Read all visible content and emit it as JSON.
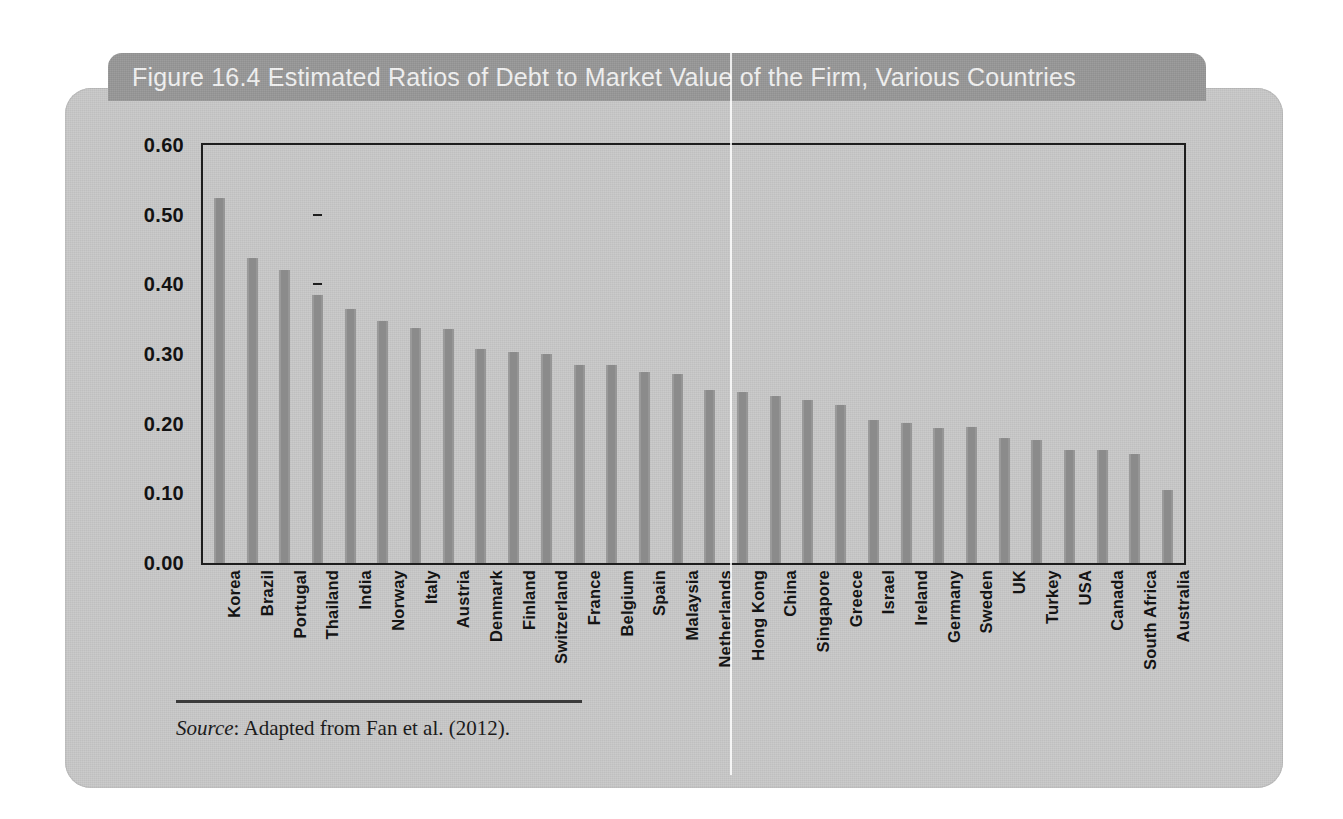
{
  "figure": {
    "number": "Figure 16.4",
    "title": "Estimated Ratios of Debt to Market Value of the Firm, Various Countries",
    "full_title": "Figure 16.4  Estimated Ratios of Debt to Market Value of the Firm, Various Countries",
    "source_label": "Source",
    "source_text": ": Adapted from Fan et al. (2012)."
  },
  "colors": {
    "card_background": "#c8c8c8",
    "title_tab": "#979797",
    "title_text": "#f2f2f2",
    "bar_fill": "#8e8e8e",
    "axis_line": "#1e1e1e",
    "label_text": "#121212"
  },
  "chart_data": {
    "type": "bar",
    "title": "Estimated Ratios of Debt to Market Value of the Firm, Various Countries",
    "subtitle": "",
    "xlabel": "",
    "ylabel": "",
    "ylim": [
      0.0,
      0.6
    ],
    "ytick_labels": [
      "0.00",
      "0.10",
      "0.20",
      "0.30",
      "0.40",
      "0.50",
      "0.60"
    ],
    "ytick_values": [
      0.0,
      0.1,
      0.2,
      0.3,
      0.4,
      0.5,
      0.6
    ],
    "grid": false,
    "legend": false,
    "orientation": "vertical",
    "categories": [
      "Korea",
      "Brazil",
      "Portugal",
      "Thailand",
      "India",
      "Norway",
      "Italy",
      "Austria",
      "Denmark",
      "Finland",
      "Switzerland",
      "France",
      "Belgium",
      "Spain",
      "Malaysia",
      "Netherlands",
      "Hong Kong",
      "China",
      "Singapore",
      "Greece",
      "Israel",
      "Ireland",
      "Germany",
      "Sweden",
      "UK",
      "Turkey",
      "USA",
      "Canada",
      "South Africa",
      "Australia"
    ],
    "values": [
      0.524,
      0.438,
      0.42,
      0.384,
      0.364,
      0.347,
      0.338,
      0.336,
      0.307,
      0.303,
      0.3,
      0.284,
      0.284,
      0.274,
      0.271,
      0.248,
      0.246,
      0.24,
      0.234,
      0.227,
      0.206,
      0.201,
      0.194,
      0.195,
      0.179,
      0.177,
      0.162,
      0.162,
      0.156,
      0.105
    ]
  }
}
